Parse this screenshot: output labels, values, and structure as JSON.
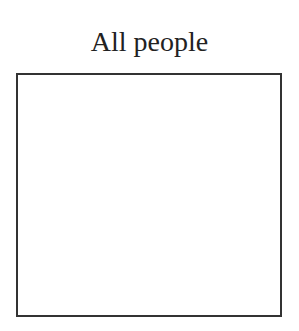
{
  "diagram": {
    "title": "All people",
    "box": {
      "label": "",
      "border_color": "#333333",
      "fill_color": "#ffffff"
    }
  }
}
